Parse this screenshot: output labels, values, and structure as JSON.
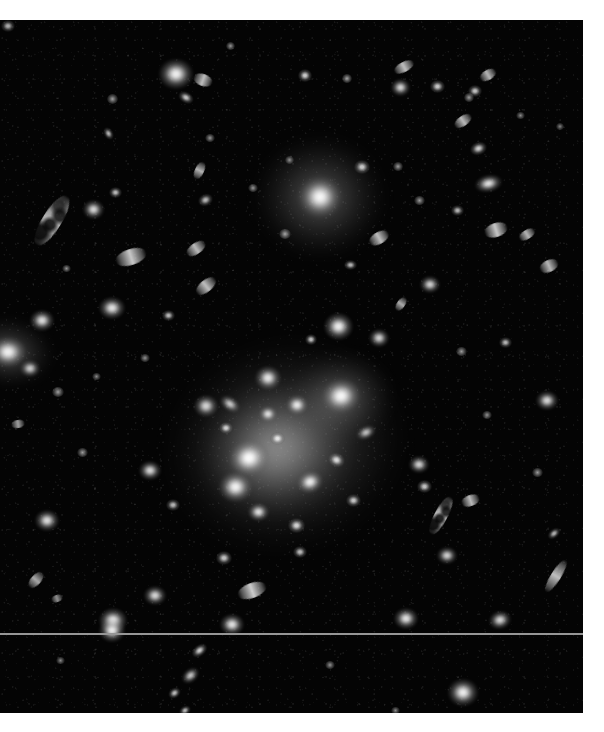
{
  "image": {
    "title": "Galaxy cluster field",
    "type": "astronomical-grayscale-plate",
    "alt_text": "Deep grayscale astronomical image of a rich galaxy cluster with a bright diffuse core, a luminous cD galaxy, and many elliptical and edge-on spiral galaxies on a dark sky background",
    "background_color": "#040404",
    "page_background_color": "#ffffff",
    "source_star_color": "#ffffff",
    "halo_color": "#d6d6d6",
    "plate": {
      "left": 0,
      "top": 20,
      "width": 583,
      "height": 693
    },
    "artifacts": {
      "scanline_label": "horizontal detector scan line",
      "scanline_y": 613,
      "scanline_color": "#969696"
    }
  },
  "chart_data": {
    "type": "scatter",
    "xlabel": "",
    "ylabel": "",
    "xlim": [
      0,
      583
    ],
    "ylim": [
      0,
      693
    ],
    "grid": false,
    "legend": "none",
    "note": "Each point is a detected source in the plate; x/y are pixel coordinates within the plate, w/h the apparent extent in pixels, b the relative surface brightness (0-1), r the position angle in degrees, k the morphological class.",
    "halos": [
      {
        "name": "cluster-core-halo",
        "x": 285,
        "y": 425,
        "w": 215,
        "h": 185,
        "b": 0.72,
        "r": -18
      },
      {
        "name": "cluster-core-inner-halo",
        "x": 275,
        "y": 430,
        "w": 140,
        "h": 120,
        "b": 0.85,
        "r": -15
      },
      {
        "name": "cd-galaxy-halo",
        "x": 320,
        "y": 177,
        "w": 120,
        "h": 112,
        "b": 0.66,
        "r": 0
      },
      {
        "name": "left-edge-galaxy-halo",
        "x": 8,
        "y": 332,
        "w": 86,
        "h": 64,
        "b": 0.62,
        "r": 8
      },
      {
        "name": "ne-core-halo",
        "x": 340,
        "y": 378,
        "w": 100,
        "h": 86,
        "b": 0.58,
        "r": -10
      }
    ],
    "sources": [
      {
        "x": 320,
        "y": 177,
        "w": 42,
        "h": 40,
        "b": 1.0,
        "r": 0,
        "k": "cd-galaxy"
      },
      {
        "x": 249,
        "y": 438,
        "w": 40,
        "h": 36,
        "b": 1.0,
        "r": -12,
        "k": "elliptical"
      },
      {
        "x": 341,
        "y": 376,
        "w": 38,
        "h": 34,
        "b": 0.98,
        "r": -8,
        "k": "elliptical"
      },
      {
        "x": 235,
        "y": 467,
        "w": 33,
        "h": 30,
        "b": 0.96,
        "r": 0,
        "k": "elliptical"
      },
      {
        "x": 297,
        "y": 385,
        "w": 22,
        "h": 20,
        "b": 0.9,
        "r": 0,
        "k": "elliptical"
      },
      {
        "x": 310,
        "y": 462,
        "w": 26,
        "h": 22,
        "b": 0.92,
        "r": -20,
        "k": "elliptical"
      },
      {
        "x": 268,
        "y": 394,
        "w": 18,
        "h": 16,
        "b": 0.86,
        "r": 0,
        "k": "compact"
      },
      {
        "x": 277,
        "y": 418,
        "w": 15,
        "h": 13,
        "b": 0.82,
        "r": 0,
        "k": "compact"
      },
      {
        "x": 336,
        "y": 440,
        "w": 17,
        "h": 14,
        "b": 0.84,
        "r": 25,
        "k": "compact"
      },
      {
        "x": 258,
        "y": 492,
        "w": 21,
        "h": 18,
        "b": 0.88,
        "r": 0,
        "k": "compact"
      },
      {
        "x": 296,
        "y": 505,
        "w": 17,
        "h": 15,
        "b": 0.82,
        "r": 0,
        "k": "compact"
      },
      {
        "x": 226,
        "y": 408,
        "w": 14,
        "h": 12,
        "b": 0.78,
        "r": 0,
        "k": "compact"
      },
      {
        "x": 353,
        "y": 480,
        "w": 15,
        "h": 13,
        "b": 0.76,
        "r": 0,
        "k": "compact"
      },
      {
        "x": 230,
        "y": 384,
        "w": 22,
        "h": 14,
        "b": 0.8,
        "r": 35,
        "k": "lenticular"
      },
      {
        "x": 366,
        "y": 412,
        "w": 20,
        "h": 13,
        "b": 0.78,
        "r": -25,
        "k": "lenticular"
      },
      {
        "x": 206,
        "y": 386,
        "w": 24,
        "h": 22,
        "b": 0.84,
        "r": 0,
        "k": "compact"
      },
      {
        "x": 268,
        "y": 358,
        "w": 26,
        "h": 24,
        "b": 0.9,
        "r": 0,
        "k": "elliptical"
      },
      {
        "x": 338,
        "y": 306,
        "w": 29,
        "h": 27,
        "b": 0.94,
        "r": 0,
        "k": "elliptical"
      },
      {
        "x": 379,
        "y": 318,
        "w": 20,
        "h": 18,
        "b": 0.84,
        "r": 0,
        "k": "compact"
      },
      {
        "x": 311,
        "y": 319,
        "w": 12,
        "h": 11,
        "b": 0.74,
        "r": 0,
        "k": "compact"
      },
      {
        "x": 176,
        "y": 54,
        "w": 34,
        "h": 30,
        "b": 0.96,
        "r": 0,
        "k": "elliptical"
      },
      {
        "x": 203,
        "y": 60,
        "w": 20,
        "h": 12,
        "b": 0.82,
        "r": 20,
        "k": "lenticular"
      },
      {
        "x": 186,
        "y": 77,
        "w": 16,
        "h": 11,
        "b": 0.76,
        "r": 30,
        "k": "lenticular"
      },
      {
        "x": 305,
        "y": 55,
        "w": 14,
        "h": 13,
        "b": 0.8,
        "r": 0,
        "k": "compact"
      },
      {
        "x": 347,
        "y": 58,
        "w": 10,
        "h": 9,
        "b": 0.68,
        "r": 0,
        "k": "point"
      },
      {
        "x": 400,
        "y": 67,
        "w": 19,
        "h": 17,
        "b": 0.86,
        "r": 0,
        "k": "compact"
      },
      {
        "x": 437,
        "y": 66,
        "w": 15,
        "h": 13,
        "b": 0.78,
        "r": 0,
        "k": "compact"
      },
      {
        "x": 404,
        "y": 47,
        "w": 22,
        "h": 10,
        "b": 0.82,
        "r": -28,
        "k": "edge-on-spiral"
      },
      {
        "x": 475,
        "y": 71,
        "w": 14,
        "h": 12,
        "b": 0.76,
        "r": 0,
        "k": "compact"
      },
      {
        "x": 488,
        "y": 55,
        "w": 18,
        "h": 10,
        "b": 0.78,
        "r": -30,
        "k": "edge-on-spiral"
      },
      {
        "x": 112,
        "y": 79,
        "w": 11,
        "h": 10,
        "b": 0.66,
        "r": 0,
        "k": "point"
      },
      {
        "x": 230,
        "y": 26,
        "w": 9,
        "h": 8,
        "b": 0.62,
        "r": 0,
        "k": "point"
      },
      {
        "x": 52,
        "y": 200,
        "w": 58,
        "h": 19,
        "b": 0.8,
        "r": -58,
        "k": "clumpy-edge-on-spiral"
      },
      {
        "x": 93,
        "y": 189,
        "w": 21,
        "h": 19,
        "b": 0.86,
        "r": 0,
        "k": "compact"
      },
      {
        "x": 115,
        "y": 172,
        "w": 13,
        "h": 11,
        "b": 0.72,
        "r": 0,
        "k": "compact"
      },
      {
        "x": 66,
        "y": 248,
        "w": 9,
        "h": 7,
        "b": 0.6,
        "r": 0,
        "k": "point"
      },
      {
        "x": 108,
        "y": 113,
        "w": 13,
        "h": 9,
        "b": 0.7,
        "r": 60,
        "k": "lenticular"
      },
      {
        "x": 469,
        "y": 77,
        "w": 10,
        "h": 9,
        "b": 0.64,
        "r": 0,
        "k": "point"
      },
      {
        "x": 463,
        "y": 101,
        "w": 20,
        "h": 10,
        "b": 0.8,
        "r": -35,
        "k": "edge-on-spiral"
      },
      {
        "x": 478,
        "y": 128,
        "w": 17,
        "h": 13,
        "b": 0.8,
        "r": -20,
        "k": "lenticular"
      },
      {
        "x": 488,
        "y": 163,
        "w": 27,
        "h": 17,
        "b": 0.9,
        "r": -12,
        "k": "lenticular"
      },
      {
        "x": 496,
        "y": 210,
        "w": 24,
        "h": 14,
        "b": 0.86,
        "r": -18,
        "k": "lenticular"
      },
      {
        "x": 527,
        "y": 214,
        "w": 18,
        "h": 9,
        "b": 0.78,
        "r": -32,
        "k": "edge-on-spiral"
      },
      {
        "x": 549,
        "y": 246,
        "w": 20,
        "h": 12,
        "b": 0.78,
        "r": -25,
        "k": "lenticular"
      },
      {
        "x": 457,
        "y": 190,
        "w": 13,
        "h": 11,
        "b": 0.7,
        "r": 0,
        "k": "compact"
      },
      {
        "x": 419,
        "y": 180,
        "w": 11,
        "h": 9,
        "b": 0.64,
        "r": 0,
        "k": "point"
      },
      {
        "x": 379,
        "y": 218,
        "w": 22,
        "h": 12,
        "b": 0.82,
        "r": -30,
        "k": "lenticular"
      },
      {
        "x": 398,
        "y": 146,
        "w": 10,
        "h": 9,
        "b": 0.64,
        "r": 0,
        "k": "point"
      },
      {
        "x": 210,
        "y": 118,
        "w": 10,
        "h": 8,
        "b": 0.62,
        "r": 0,
        "k": "point"
      },
      {
        "x": 131,
        "y": 237,
        "w": 32,
        "h": 16,
        "b": 0.86,
        "r": -18,
        "k": "lenticular"
      },
      {
        "x": 196,
        "y": 228,
        "w": 22,
        "h": 11,
        "b": 0.8,
        "r": -35,
        "k": "edge-on-spiral"
      },
      {
        "x": 206,
        "y": 266,
        "w": 24,
        "h": 12,
        "b": 0.82,
        "r": -40,
        "k": "edge-on-spiral"
      },
      {
        "x": 205,
        "y": 180,
        "w": 15,
        "h": 12,
        "b": 0.72,
        "r": -25,
        "k": "lenticular"
      },
      {
        "x": 199,
        "y": 150,
        "w": 19,
        "h": 9,
        "b": 0.76,
        "r": -65,
        "k": "edge-on-spiral"
      },
      {
        "x": 168,
        "y": 295,
        "w": 13,
        "h": 11,
        "b": 0.72,
        "r": 0,
        "k": "compact"
      },
      {
        "x": 112,
        "y": 288,
        "w": 26,
        "h": 22,
        "b": 0.9,
        "r": 0,
        "k": "elliptical"
      },
      {
        "x": 42,
        "y": 300,
        "w": 24,
        "h": 21,
        "b": 0.88,
        "r": 0,
        "k": "elliptical"
      },
      {
        "x": 8,
        "y": 332,
        "w": 36,
        "h": 30,
        "b": 0.94,
        "r": 0,
        "k": "elliptical"
      },
      {
        "x": 30,
        "y": 348,
        "w": 20,
        "h": 17,
        "b": 0.8,
        "r": 0,
        "k": "compact"
      },
      {
        "x": 58,
        "y": 372,
        "w": 12,
        "h": 10,
        "b": 0.66,
        "r": 0,
        "k": "point"
      },
      {
        "x": 18,
        "y": 404,
        "w": 14,
        "h": 8,
        "b": 0.68,
        "r": -10,
        "k": "lenticular"
      },
      {
        "x": 82,
        "y": 432,
        "w": 11,
        "h": 9,
        "b": 0.64,
        "r": 0,
        "k": "point"
      },
      {
        "x": 150,
        "y": 450,
        "w": 22,
        "h": 19,
        "b": 0.86,
        "r": 0,
        "k": "compact"
      },
      {
        "x": 173,
        "y": 485,
        "w": 14,
        "h": 12,
        "b": 0.7,
        "r": 0,
        "k": "compact"
      },
      {
        "x": 47,
        "y": 500,
        "w": 24,
        "h": 21,
        "b": 0.88,
        "r": 0,
        "k": "elliptical"
      },
      {
        "x": 36,
        "y": 560,
        "w": 20,
        "h": 10,
        "b": 0.72,
        "r": -48,
        "k": "edge-on-spiral"
      },
      {
        "x": 57,
        "y": 578,
        "w": 12,
        "h": 7,
        "b": 0.62,
        "r": -20,
        "k": "lenticular"
      },
      {
        "x": 155,
        "y": 575,
        "w": 22,
        "h": 19,
        "b": 0.86,
        "r": 0,
        "k": "compact"
      },
      {
        "x": 113,
        "y": 600,
        "w": 28,
        "h": 25,
        "b": 0.94,
        "r": 0,
        "k": "elliptical"
      },
      {
        "x": 252,
        "y": 570,
        "w": 30,
        "h": 15,
        "b": 0.88,
        "r": -20,
        "k": "lenticular"
      },
      {
        "x": 224,
        "y": 538,
        "w": 16,
        "h": 14,
        "b": 0.76,
        "r": 0,
        "k": "compact"
      },
      {
        "x": 300,
        "y": 532,
        "w": 14,
        "h": 12,
        "b": 0.72,
        "r": 0,
        "k": "compact"
      },
      {
        "x": 232,
        "y": 604,
        "w": 24,
        "h": 21,
        "b": 0.9,
        "r": 0,
        "k": "elliptical"
      },
      {
        "x": 112,
        "y": 610,
        "w": 26,
        "h": 23,
        "b": 0.92,
        "r": 0,
        "k": "elliptical"
      },
      {
        "x": 199,
        "y": 630,
        "w": 17,
        "h": 11,
        "b": 0.8,
        "r": -38,
        "k": "lenticular"
      },
      {
        "x": 190,
        "y": 655,
        "w": 19,
        "h": 13,
        "b": 0.82,
        "r": -40,
        "k": "lenticular"
      },
      {
        "x": 174,
        "y": 673,
        "w": 13,
        "h": 10,
        "b": 0.74,
        "r": -35,
        "k": "lenticular"
      },
      {
        "x": 185,
        "y": 690,
        "w": 12,
        "h": 9,
        "b": 0.72,
        "r": -30,
        "k": "lenticular"
      },
      {
        "x": 463,
        "y": 672,
        "w": 30,
        "h": 27,
        "b": 0.96,
        "r": 0,
        "k": "elliptical"
      },
      {
        "x": 406,
        "y": 598,
        "w": 24,
        "h": 21,
        "b": 0.9,
        "r": 0,
        "k": "elliptical"
      },
      {
        "x": 500,
        "y": 600,
        "w": 22,
        "h": 18,
        "b": 0.86,
        "r": -15,
        "k": "lenticular"
      },
      {
        "x": 441,
        "y": 495,
        "w": 42,
        "h": 13,
        "b": 0.84,
        "r": -62,
        "k": "clumpy-edge-on-spiral"
      },
      {
        "x": 424,
        "y": 466,
        "w": 15,
        "h": 13,
        "b": 0.76,
        "r": 0,
        "k": "compact"
      },
      {
        "x": 419,
        "y": 444,
        "w": 20,
        "h": 17,
        "b": 0.84,
        "r": 0,
        "k": "compact"
      },
      {
        "x": 470,
        "y": 480,
        "w": 19,
        "h": 11,
        "b": 0.8,
        "r": -20,
        "k": "lenticular"
      },
      {
        "x": 447,
        "y": 535,
        "w": 20,
        "h": 17,
        "b": 0.84,
        "r": 0,
        "k": "compact"
      },
      {
        "x": 556,
        "y": 556,
        "w": 38,
        "h": 10,
        "b": 0.82,
        "r": -58,
        "k": "edge-on-spiral"
      },
      {
        "x": 554,
        "y": 513,
        "w": 14,
        "h": 9,
        "b": 0.7,
        "r": -40,
        "k": "lenticular"
      },
      {
        "x": 537,
        "y": 452,
        "w": 11,
        "h": 9,
        "b": 0.64,
        "r": 0,
        "k": "point"
      },
      {
        "x": 547,
        "y": 380,
        "w": 22,
        "h": 19,
        "b": 0.86,
        "r": 0,
        "k": "compact"
      },
      {
        "x": 505,
        "y": 322,
        "w": 13,
        "h": 11,
        "b": 0.7,
        "r": 0,
        "k": "compact"
      },
      {
        "x": 461,
        "y": 331,
        "w": 11,
        "h": 9,
        "b": 0.64,
        "r": 0,
        "k": "point"
      },
      {
        "x": 487,
        "y": 395,
        "w": 10,
        "h": 8,
        "b": 0.6,
        "r": 0,
        "k": "point"
      },
      {
        "x": 430,
        "y": 264,
        "w": 20,
        "h": 17,
        "b": 0.84,
        "r": 0,
        "k": "compact"
      },
      {
        "x": 401,
        "y": 284,
        "w": 16,
        "h": 8,
        "b": 0.74,
        "r": -55,
        "k": "edge-on-spiral"
      },
      {
        "x": 285,
        "y": 214,
        "w": 12,
        "h": 10,
        "b": 0.68,
        "r": 0,
        "k": "point"
      },
      {
        "x": 253,
        "y": 168,
        "w": 10,
        "h": 8,
        "b": 0.62,
        "r": 0,
        "k": "point"
      },
      {
        "x": 362,
        "y": 147,
        "w": 16,
        "h": 14,
        "b": 0.78,
        "r": 0,
        "k": "compact"
      },
      {
        "x": 289,
        "y": 140,
        "w": 9,
        "h": 8,
        "b": 0.58,
        "r": 0,
        "k": "point"
      },
      {
        "x": 350,
        "y": 245,
        "w": 13,
        "h": 10,
        "b": 0.7,
        "r": 0,
        "k": "compact"
      },
      {
        "x": 145,
        "y": 338,
        "w": 10,
        "h": 8,
        "b": 0.6,
        "r": 0,
        "k": "point"
      },
      {
        "x": 96,
        "y": 356,
        "w": 9,
        "h": 7,
        "b": 0.56,
        "r": 0,
        "k": "point"
      },
      {
        "x": 330,
        "y": 645,
        "w": 10,
        "h": 8,
        "b": 0.6,
        "r": 0,
        "k": "point"
      },
      {
        "x": 395,
        "y": 690,
        "w": 9,
        "h": 7,
        "b": 0.56,
        "r": 0,
        "k": "point"
      },
      {
        "x": 60,
        "y": 640,
        "w": 9,
        "h": 7,
        "b": 0.56,
        "r": 0,
        "k": "point"
      },
      {
        "x": 520,
        "y": 95,
        "w": 9,
        "h": 7,
        "b": 0.56,
        "r": 0,
        "k": "point"
      },
      {
        "x": 560,
        "y": 106,
        "w": 8,
        "h": 7,
        "b": 0.54,
        "r": 0,
        "k": "point"
      },
      {
        "x": 8,
        "y": 6,
        "w": 14,
        "h": 12,
        "b": 0.7,
        "r": 0,
        "k": "compact"
      }
    ]
  }
}
